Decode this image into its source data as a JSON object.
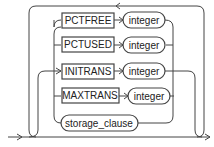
{
  "diagram": {
    "type": "railroad-syntax",
    "keywords": [
      {
        "label": "PCTFREE",
        "param": "integer"
      },
      {
        "label": "PCTUSED",
        "param": "integer"
      },
      {
        "label": "INITRANS",
        "param": "integer"
      },
      {
        "label": "MAXTRANS",
        "param": "integer"
      }
    ],
    "clause": "storage_clause"
  }
}
